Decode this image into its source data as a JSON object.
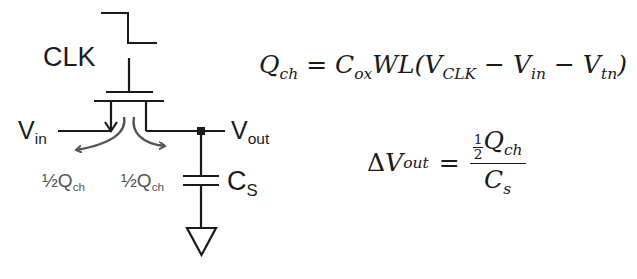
{
  "circuit": {
    "clock_label": "CLK",
    "vin_label": "V",
    "vin_sub": "in",
    "vout_label": "V",
    "vout_sub": "out",
    "cap_label": "C",
    "cap_sub": "S",
    "charge_left": "½Q",
    "charge_left_sub": "ch",
    "charge_right": "½Q",
    "charge_right_sub": "ch",
    "wire_color": "#1a1a1a",
    "arrow_color": "#555555"
  },
  "equations": {
    "qch": {
      "lhs": "Q",
      "lhs_sub": "ch",
      "equals": "=",
      "cox": "C",
      "cox_sub": "ox",
      "wl": "WL(",
      "v1": "V",
      "v1_sub": "CLK",
      "minus1": "−",
      "v2": "V",
      "v2_sub": "in",
      "minus2": "−",
      "v3": "V",
      "v3_sub": "tn",
      "close": ")"
    },
    "dvout": {
      "delta": "Δ",
      "lhs": "V",
      "lhs_sub": "out",
      "equals": "=",
      "half_num": "1",
      "half_den": "2",
      "num": "Q",
      "num_sub": "ch",
      "den": "C",
      "den_sub": "s"
    }
  }
}
